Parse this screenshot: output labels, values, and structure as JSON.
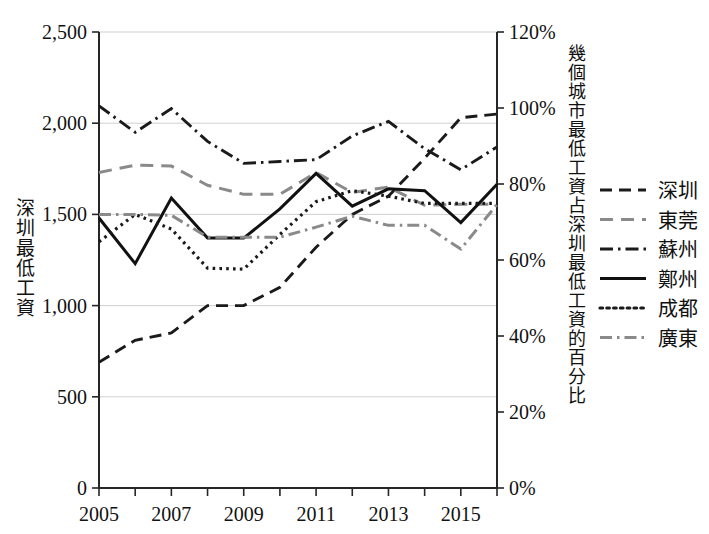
{
  "axes": {
    "left_title": "深圳最低工資",
    "right_title": "幾個城市最低工資占深圳最低工資的百分比",
    "y_left_ticks": [
      "0",
      "500",
      "1,000",
      "1,500",
      "2,000",
      "2,500"
    ],
    "y_right_ticks": [
      "0%",
      "20%",
      "40%",
      "60%",
      "80%",
      "100%",
      "120%"
    ],
    "x_ticks_visible": [
      "2005",
      "2007",
      "2009",
      "2011",
      "2013",
      "2015"
    ]
  },
  "legend": {
    "items": [
      {
        "label": "深圳",
        "style": "dashed",
        "color": "#1a1a1a"
      },
      {
        "label": "東莞",
        "style": "dashed-gray",
        "color": "#8a8a8a"
      },
      {
        "label": "蘇州",
        "style": "dash-dot",
        "color": "#1a1a1a"
      },
      {
        "label": "鄭州",
        "style": "solid",
        "color": "#111111"
      },
      {
        "label": "成都",
        "style": "dotted",
        "color": "#1a1a1a"
      },
      {
        "label": "廣東",
        "style": "dash-dot-gray",
        "color": "#8a8a8a"
      }
    ]
  },
  "chart_data": {
    "type": "line",
    "title": "",
    "xlabel": "",
    "ylabel": "深圳最低工資",
    "y2label": "幾個城市最低工資占深圳最低工資的百分比",
    "x": [
      2005,
      2006,
      2007,
      2008,
      2009,
      2010,
      2011,
      2012,
      2013,
      2014,
      2015,
      2016
    ],
    "xlim": [
      2005,
      2016
    ],
    "ylim": [
      0,
      2500
    ],
    "y2lim": [
      0,
      120
    ],
    "yticks": [
      0,
      500,
      1000,
      1500,
      2000,
      2500
    ],
    "y2ticks": [
      0,
      20,
      40,
      60,
      80,
      100,
      120
    ],
    "grid": true,
    "legend_position": "right",
    "series": [
      {
        "name": "深圳",
        "style": "dashed",
        "color": "#1a1a1a",
        "values": [
          690,
          810,
          850,
          1000,
          1000,
          1100,
          1320,
          1500,
          1600,
          1808,
          2030,
          2050
        ]
      },
      {
        "name": "東莞",
        "style": "dashed-gray",
        "color": "#8a8a8a",
        "values": [
          1730,
          1770,
          1765,
          1660,
          1610,
          1610,
          1730,
          1620,
          1650,
          1550,
          1555,
          1555
        ]
      },
      {
        "name": "蘇州",
        "style": "dash-dot",
        "color": "#1a1a1a",
        "values": [
          2095,
          1950,
          2080,
          1900,
          1780,
          1790,
          1800,
          1930,
          2010,
          1860,
          1745,
          1870
        ]
      },
      {
        "name": "鄭州",
        "style": "solid",
        "color": "#111111",
        "values": [
          1480,
          1230,
          1590,
          1370,
          1370,
          1530,
          1725,
          1545,
          1640,
          1630,
          1455,
          1665
        ]
      },
      {
        "name": "成都",
        "style": "dotted",
        "color": "#1a1a1a",
        "values": [
          1350,
          1500,
          1420,
          1205,
          1200,
          1390,
          1570,
          1630,
          1600,
          1560,
          1560,
          1560
        ]
      },
      {
        "name": "廣東",
        "style": "dash-dot-gray",
        "color": "#8a8a8a",
        "values": [
          1500,
          1500,
          1495,
          1375,
          1375,
          1375,
          1430,
          1490,
          1440,
          1440,
          1310,
          1555
        ]
      }
    ]
  }
}
